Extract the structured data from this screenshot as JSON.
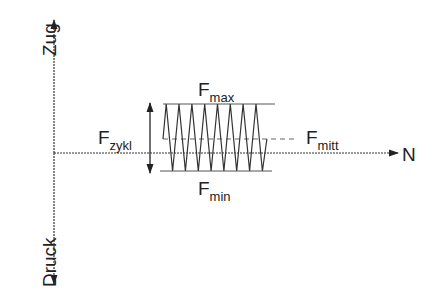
{
  "diagram": {
    "axes": {
      "vertical_top_label": "Zug",
      "vertical_bottom_label": "Druck",
      "horizontal_label": "N"
    },
    "labels": {
      "f_max": {
        "main": "F",
        "sub": "max"
      },
      "f_min": {
        "main": "F",
        "sub": "min"
      },
      "f_mitt": {
        "main": "F",
        "sub": "mitt"
      },
      "f_zykl": {
        "main": "F",
        "sub": "zykl"
      }
    },
    "wave": {
      "cycles": 8,
      "x_start": 163,
      "x_end": 272,
      "y_max": 104,
      "y_min": 171,
      "y_mean": 139
    },
    "colors": {
      "line": "#333333",
      "text": "#222222"
    }
  }
}
